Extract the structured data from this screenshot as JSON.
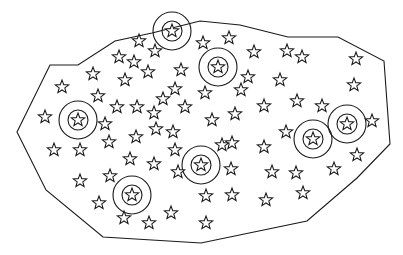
{
  "diagram": {
    "type": "scatter-region",
    "colors": {
      "stroke": "#1a1a1a",
      "background": "#ffffff"
    },
    "boundary_polygon": [
      [
        50,
        65
      ],
      [
        78,
        65
      ],
      [
        115,
        41
      ],
      [
        152,
        33
      ],
      [
        200,
        21
      ],
      [
        240,
        25
      ],
      [
        288,
        37
      ],
      [
        338,
        37
      ],
      [
        384,
        61
      ],
      [
        390,
        144
      ],
      [
        357,
        178
      ],
      [
        307,
        221
      ],
      [
        201,
        243
      ],
      [
        103,
        237
      ],
      [
        46,
        190
      ],
      [
        17,
        132
      ]
    ],
    "circled_stars": [
      {
        "x": 172,
        "y": 31
      },
      {
        "x": 218,
        "y": 67
      },
      {
        "x": 78,
        "y": 120
      },
      {
        "x": 201,
        "y": 165
      },
      {
        "x": 313,
        "y": 139
      },
      {
        "x": 347,
        "y": 124
      },
      {
        "x": 132,
        "y": 195
      }
    ],
    "ring_radii": {
      "outer": 19,
      "inner": 10
    },
    "star_marker": {
      "icon": "star-outline-icon",
      "radius": 7
    },
    "stars": [
      {
        "x": 139,
        "y": 41
      },
      {
        "x": 155,
        "y": 51
      },
      {
        "x": 119,
        "y": 57
      },
      {
        "x": 134,
        "y": 62
      },
      {
        "x": 148,
        "y": 72
      },
      {
        "x": 125,
        "y": 80
      },
      {
        "x": 93,
        "y": 74
      },
      {
        "x": 62,
        "y": 87
      },
      {
        "x": 98,
        "y": 96
      },
      {
        "x": 117,
        "y": 107
      },
      {
        "x": 137,
        "y": 107
      },
      {
        "x": 154,
        "y": 113
      },
      {
        "x": 181,
        "y": 70
      },
      {
        "x": 203,
        "y": 43
      },
      {
        "x": 229,
        "y": 38
      },
      {
        "x": 254,
        "y": 52
      },
      {
        "x": 287,
        "y": 51
      },
      {
        "x": 302,
        "y": 57
      },
      {
        "x": 356,
        "y": 59
      },
      {
        "x": 248,
        "y": 77
      },
      {
        "x": 280,
        "y": 80
      },
      {
        "x": 297,
        "y": 101
      },
      {
        "x": 322,
        "y": 106
      },
      {
        "x": 354,
        "y": 85
      },
      {
        "x": 205,
        "y": 93
      },
      {
        "x": 241,
        "y": 90
      },
      {
        "x": 235,
        "y": 114
      },
      {
        "x": 264,
        "y": 106
      },
      {
        "x": 175,
        "y": 89
      },
      {
        "x": 163,
        "y": 99
      },
      {
        "x": 185,
        "y": 107
      },
      {
        "x": 212,
        "y": 120
      },
      {
        "x": 45,
        "y": 117
      },
      {
        "x": 105,
        "y": 124
      },
      {
        "x": 54,
        "y": 150
      },
      {
        "x": 80,
        "y": 150
      },
      {
        "x": 109,
        "y": 142
      },
      {
        "x": 136,
        "y": 137
      },
      {
        "x": 156,
        "y": 129
      },
      {
        "x": 173,
        "y": 132
      },
      {
        "x": 130,
        "y": 159
      },
      {
        "x": 154,
        "y": 164
      },
      {
        "x": 178,
        "y": 172
      },
      {
        "x": 175,
        "y": 150
      },
      {
        "x": 232,
        "y": 143
      },
      {
        "x": 231,
        "y": 169
      },
      {
        "x": 264,
        "y": 147
      },
      {
        "x": 286,
        "y": 132
      },
      {
        "x": 372,
        "y": 121
      },
      {
        "x": 357,
        "y": 155
      },
      {
        "x": 334,
        "y": 169
      },
      {
        "x": 296,
        "y": 173
      },
      {
        "x": 272,
        "y": 172
      },
      {
        "x": 303,
        "y": 193
      },
      {
        "x": 266,
        "y": 200
      },
      {
        "x": 232,
        "y": 195
      },
      {
        "x": 206,
        "y": 196
      },
      {
        "x": 206,
        "y": 223
      },
      {
        "x": 80,
        "y": 181
      },
      {
        "x": 110,
        "y": 176
      },
      {
        "x": 99,
        "y": 203
      },
      {
        "x": 124,
        "y": 218
      },
      {
        "x": 149,
        "y": 223
      },
      {
        "x": 171,
        "y": 213
      },
      {
        "x": 222,
        "y": 145
      }
    ]
  }
}
